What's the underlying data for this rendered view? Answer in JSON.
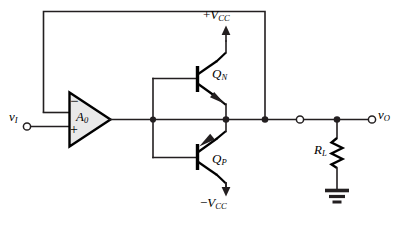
{
  "figure": {
    "kind": "circuit-schematic",
    "colors": {
      "wire": "#231f20",
      "device": "#000000",
      "opamp_fill": "#e9e9e9",
      "background": "#ffffff"
    }
  },
  "labels": {
    "input": {
      "v": "v",
      "sub": "I"
    },
    "output": {
      "v": "v",
      "sub": "O"
    },
    "opamp": {
      "gain": "A",
      "sub": "0",
      "inverting": "−",
      "noninverting": "+"
    },
    "supply_positive": {
      "sign": "+",
      "v": "V",
      "sub": "CC"
    },
    "supply_negative": {
      "sign": "−",
      "v": "V",
      "sub": "CC"
    },
    "transistor_npn": {
      "q": "Q",
      "sub": "N"
    },
    "transistor_pnp": {
      "q": "Q",
      "sub": "P"
    },
    "load_resistor": {
      "r": "R",
      "sub": "L"
    }
  },
  "components": [
    {
      "name": "op-amp",
      "label": "A0",
      "type": "amplifier"
    },
    {
      "name": "transistor-qn",
      "label": "QN",
      "type": "npn-bjt"
    },
    {
      "name": "transistor-qp",
      "label": "QP",
      "type": "pnp-bjt"
    },
    {
      "name": "load-resistor",
      "label": "RL",
      "type": "resistor"
    },
    {
      "name": "ground",
      "label": "",
      "type": "ground"
    }
  ],
  "terminals": [
    {
      "name": "input-terminal",
      "label": "vI",
      "style": "open-circle"
    },
    {
      "name": "output-terminal",
      "label": "vO",
      "style": "open-circle"
    },
    {
      "name": "output-node-terminal",
      "label": "",
      "style": "open-circle"
    }
  ],
  "nodes": [
    {
      "name": "base-rail-junction",
      "style": "solid-dot"
    },
    {
      "name": "emitter-output-junction",
      "style": "solid-dot"
    },
    {
      "name": "feedback-tap-junction",
      "style": "solid-dot"
    },
    {
      "name": "load-junction",
      "style": "solid-dot"
    }
  ]
}
